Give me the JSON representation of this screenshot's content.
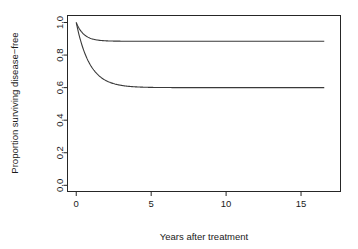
{
  "chart_data": {
    "type": "line",
    "title": "",
    "xlabel": "Years after treatment",
    "ylabel": "Proportion surviving disease−free",
    "xlim": [
      -0.55,
      17.6
    ],
    "ylim": [
      -0.035,
      1.04
    ],
    "grid": false,
    "legend_position": "none",
    "xticks": [
      0,
      5,
      10,
      15
    ],
    "xtick_labels": [
      "0",
      "5",
      "10",
      "15"
    ],
    "yticks": [
      0.0,
      0.2,
      0.4,
      0.6,
      0.8,
      1.0
    ],
    "ytick_labels": [
      "0.0",
      "0.2",
      "0.4",
      "0.6",
      "0.8",
      "1.0"
    ],
    "x_data_max": 16.55,
    "series": [
      {
        "name": "upper-curve",
        "plateau": 0.885,
        "start": 1.0,
        "decay_rate": 1.95,
        "x": [
          0,
          0.1,
          0.2,
          0.3,
          0.5,
          0.7,
          1.0,
          1.3,
          1.6,
          2.0,
          2.5,
          3.0,
          3.5,
          4.0,
          5.0,
          6.0,
          8.0,
          10.0,
          12.0,
          14.0,
          16.55
        ],
        "values": [
          1.0,
          0.98,
          0.963,
          0.949,
          0.928,
          0.914,
          0.901,
          0.894,
          0.891,
          0.888,
          0.886,
          0.885,
          0.885,
          0.885,
          0.885,
          0.885,
          0.885,
          0.885,
          0.885,
          0.885,
          0.885
        ]
      },
      {
        "name": "lower-curve",
        "plateau": 0.6,
        "start": 1.0,
        "decay_rate": 1.12,
        "x": [
          0,
          0.1,
          0.2,
          0.3,
          0.5,
          0.7,
          1.0,
          1.3,
          1.6,
          2.0,
          2.5,
          3.0,
          3.5,
          4.0,
          5.0,
          6.0,
          8.0,
          10.0,
          12.0,
          14.0,
          16.55
        ],
        "values": [
          1.0,
          0.958,
          0.92,
          0.886,
          0.828,
          0.781,
          0.73,
          0.694,
          0.667,
          0.643,
          0.625,
          0.614,
          0.608,
          0.605,
          0.601,
          0.6,
          0.6,
          0.6,
          0.6,
          0.6,
          0.6
        ]
      }
    ]
  },
  "axes": {
    "x_title": "Years after treatment",
    "y_title": "Proportion surviving disease−free"
  }
}
